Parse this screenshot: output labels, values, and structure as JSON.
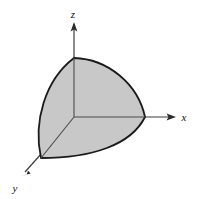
{
  "figure": {
    "background_color": "#ffffff",
    "surface_fill_color": "#c8c8c8",
    "outline_color": "#1a1a1a",
    "axis_color": "#3d3d3d",
    "label_color": "#111111"
  },
  "axes": {
    "origin": {
      "x": 74,
      "y": 117
    },
    "z_axis": {
      "label": "z",
      "label_x": 73,
      "label_y": 18,
      "line_from": {
        "x": 74,
        "y": 117
      },
      "line_to": {
        "x": 74,
        "y": 24
      },
      "arrow_tip": {
        "x": 74,
        "y": 22
      },
      "direction": "up"
    },
    "x_axis": {
      "label": "x",
      "label_x": 184,
      "label_y": 121,
      "line_from": {
        "x": 74,
        "y": 117
      },
      "line_to": {
        "x": 172,
        "y": 117
      },
      "arrow_tip": {
        "x": 176,
        "y": 117
      },
      "direction": "right"
    },
    "y_axis": {
      "label": "y",
      "label_x": 15,
      "label_y": 192,
      "line_from": {
        "x": 74,
        "y": 117
      },
      "line_to": {
        "x": 25,
        "y": 172
      },
      "arrow_tip": {
        "x": 21,
        "y": 176
      },
      "direction": "down-left"
    }
  },
  "solid": {
    "name": "octant-of-sphere",
    "vertex_top": {
      "x": 74,
      "y": 58
    },
    "vertex_right": {
      "x": 145,
      "y": 117
    },
    "vertex_lower_left": {
      "x": 41,
      "y": 158
    },
    "edge_top_right_curve": "M 74 58 C 108 59 138 84 145 117",
    "edge_bottom_curve": "M 145 117 C 131 145 92 158 41 158",
    "edge_left_curve": "M 41 158 C 33 122 45 80 74 58",
    "interior_edge_vertical": "M 74 58 L 74 117",
    "interior_edge_horizontal": "M 74 117 L 145 117",
    "interior_edge_diagonal": "M 74 117 L 41 158",
    "outline_width": 1.8,
    "interior_line_width": 1.0
  }
}
